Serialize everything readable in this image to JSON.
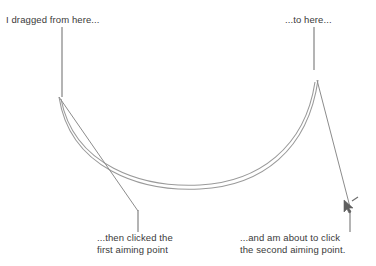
{
  "canvas": {
    "width": 376,
    "height": 266,
    "background_color": "#ffffff",
    "stroke_color": "#8a8a8a",
    "text_color": "#3a3a3a"
  },
  "annotations": {
    "dragged_from": "I dragged from here...",
    "to_here": "...to here...",
    "first_aiming_point_line1": "...then clicked the",
    "first_aiming_point_line2": "first aiming point",
    "second_aiming_point_line1": "...and am about to click",
    "second_aiming_point_line2": "the second aiming point."
  },
  "graphics": {
    "leader_top_left": {
      "x": 62,
      "y1": 27,
      "y2": 97
    },
    "leader_top_right": {
      "x": 314,
      "y1": 27,
      "y2": 70
    },
    "leader_bottom_left": {
      "x": 138,
      "y1": 210,
      "y2": 232
    },
    "leader_bottom_right": {
      "x": 350,
      "y1": 210,
      "y2": 232
    },
    "drag_start_point": {
      "x": 59,
      "y": 97
    },
    "drag_end_point": {
      "x": 318,
      "y": 80
    },
    "first_aiming_point": {
      "x": 138,
      "y": 211
    },
    "second_aiming_point": {
      "x": 350,
      "y": 208
    },
    "curve_outer": "M59,97 C70,168 140,192 200,189 C262,186 308,150 318,80",
    "curve_inner": "M61,99 C74,166 142,188 200,185 C258,182 305,148 315,82",
    "aim_line_left": "M59,97 L138,211",
    "aim_line_right": "M317,80 L350,207",
    "cursor_icon": "mouse-cursor-arrow"
  }
}
